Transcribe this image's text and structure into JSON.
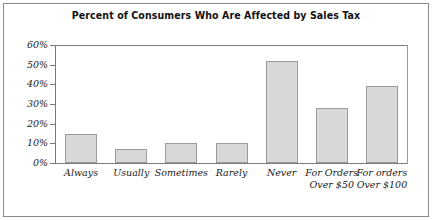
{
  "chart_data": {
    "type": "bar",
    "title": "Percent of Consumers Who Are Affected by Sales Tax",
    "xlabel": "",
    "ylabel": "",
    "ylim": [
      0,
      60
    ],
    "grid": false,
    "legend": null,
    "categories": [
      "Always",
      "Usually",
      "Sometimes",
      "Rarely",
      "Never",
      "For Orders Over $50",
      "For orders Over $100"
    ],
    "category_lines": [
      [
        "Always"
      ],
      [
        "Usually"
      ],
      [
        "Sometimes"
      ],
      [
        "Rarely"
      ],
      [
        "Never"
      ],
      [
        "For Orders",
        "Over $50"
      ],
      [
        "For orders",
        "Over $100"
      ]
    ],
    "values": [
      15,
      7,
      10,
      10,
      52,
      28,
      39
    ],
    "ytick_labels": [
      "60%",
      "50%",
      "40%",
      "30%",
      "20%",
      "10%",
      "0%"
    ],
    "ytick_values": [
      60,
      50,
      40,
      30,
      20,
      10,
      0
    ],
    "colors": {
      "bar_fill": "#d8d8d8",
      "bar_border": "#9b9b9b",
      "axis": "#7a7a7a",
      "frame": "#8c8c8c",
      "text": "#111111",
      "background": "#ffffff"
    }
  }
}
